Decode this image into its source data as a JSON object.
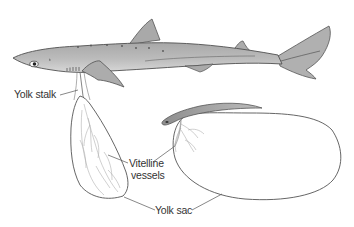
{
  "diagram": {
    "labels": {
      "yolk_stalk": "Yolk stalk",
      "vitelline_line1": "Vitelline",
      "vitelline_line2": "vessels",
      "yolk_sac": "Yolk sac"
    },
    "colors": {
      "shark_body": "#b4b4b4",
      "shark_light": "#d6d6d6",
      "outline": "#4a4a4a",
      "vessels": "#9a9a9a",
      "embryo": "#9c9c9c",
      "text": "#333333"
    }
  }
}
